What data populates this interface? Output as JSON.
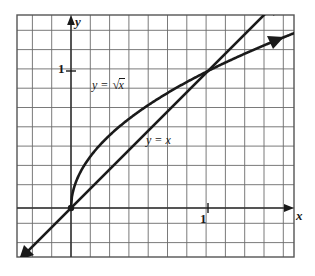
{
  "figure": {
    "type": "math-graph",
    "background_color": "#ffffff",
    "frame": {
      "left": 17,
      "top": 15,
      "right": 294,
      "bottom": 257,
      "border_color": "#555555"
    },
    "grid": {
      "spacing_px": 19.3,
      "color": "#6b6b6b",
      "visible": true
    },
    "axes": {
      "origin_px": {
        "x": 71,
        "y": 208
      },
      "unit_px": 137,
      "x_axis": {
        "label": "x",
        "tick_label": "1",
        "color": "#1a1a1a",
        "arrow": true
      },
      "y_axis": {
        "label": "y",
        "tick_label": "1",
        "color": "#1a1a1a",
        "arrow": true
      }
    }
  },
  "chart_data": {
    "type": "line",
    "title": "",
    "xlabel": "x",
    "ylabel": "y",
    "xlim": [
      -0.4,
      1.65
    ],
    "ylim": [
      -0.36,
      1.41
    ],
    "grid": true,
    "legend": "inline-annotations",
    "annotations": [
      {
        "text": "y = √x",
        "x": 0.18,
        "y": 0.97
      },
      {
        "text": "y = x",
        "x": 0.57,
        "y": 0.56
      },
      {
        "text": "1",
        "axis": "y",
        "x": -0.1,
        "y": 1.0
      },
      {
        "text": "1",
        "axis": "x",
        "x": 0.95,
        "y": -0.05
      }
    ],
    "series": [
      {
        "name": "y = x",
        "label": "y = x",
        "color": "#1a1a1a",
        "arrow_start": true,
        "arrow_end": true,
        "x": [
          -0.37,
          -0.2,
          0,
          0.2,
          0.4,
          0.6,
          0.8,
          1.0,
          1.2,
          1.4,
          1.53
        ],
        "y": [
          -0.37,
          -0.2,
          0,
          0.2,
          0.4,
          0.6,
          0.8,
          1.0,
          1.2,
          1.4,
          1.53
        ]
      },
      {
        "name": "y = sqrt(x)",
        "label": "y = √x",
        "color": "#1a1a1a",
        "arrow_start": false,
        "arrow_end": true,
        "x": [
          0,
          0.05,
          0.1,
          0.2,
          0.3,
          0.4,
          0.5,
          0.6,
          0.7,
          0.8,
          0.9,
          1.0,
          1.1,
          1.2,
          1.3,
          1.4,
          1.55
        ],
        "y": [
          0,
          0.2236,
          0.3162,
          0.4472,
          0.5477,
          0.6325,
          0.7071,
          0.7746,
          0.8367,
          0.8944,
          0.9487,
          1.0,
          1.0488,
          1.0954,
          1.1402,
          1.1832,
          1.245
        ]
      }
    ],
    "intersections": [
      {
        "x": 0,
        "y": 0
      },
      {
        "x": 1,
        "y": 1
      }
    ]
  },
  "labels": {
    "sqrt_curve": {
      "lhs": "y",
      "eq": "=",
      "radical_sign": "√",
      "radicand": "x"
    },
    "linear_curve": "y = x",
    "y_tick": "1",
    "x_tick": "1",
    "y_axis_name": "y",
    "x_axis_name": "x"
  }
}
